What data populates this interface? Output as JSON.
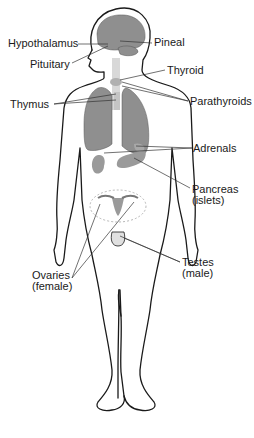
{
  "diagram": {
    "labels": {
      "hypothalamus": "Hypothalamus",
      "pineal": "Pineal",
      "pituitary": "Pituitary",
      "thyroid": "Thyroid",
      "thymus": "Thymus",
      "parathyroids": "Parathyroids",
      "adrenals": "Adrenals",
      "pancreas": {
        "line1": "Pancreas",
        "line2": "(islets)"
      },
      "testes": {
        "line1": "Testes",
        "line2": "(male)"
      },
      "ovaries": {
        "line1": "Ovaries",
        "line2": "(female)"
      }
    },
    "colors": {
      "outline": "#1a1a1a",
      "organ_fill": "#8f8f8f",
      "organ_light": "#b8b8b8",
      "leader_line": "#333333"
    }
  }
}
